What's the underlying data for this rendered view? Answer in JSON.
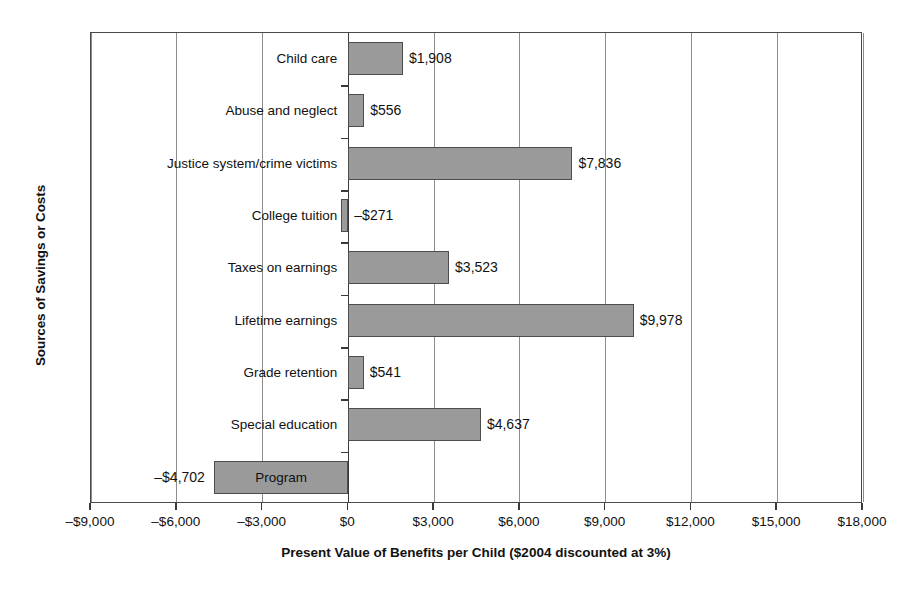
{
  "chart_data": {
    "type": "bar",
    "orientation": "horizontal",
    "title": "",
    "xlabel": "Present Value of Benefits per Child ($2004 discounted at 3%)",
    "ylabel": "Sources of Savings or Costs",
    "xlim": [
      -9000,
      18000
    ],
    "xticks": [
      -9000,
      -6000,
      -3000,
      0,
      3000,
      6000,
      9000,
      12000,
      15000,
      18000
    ],
    "xtick_labels": [
      "–$9,000",
      "–$6,000",
      "–$3,000",
      "$0",
      "$3,000",
      "$6,000",
      "$9,000",
      "$12,000",
      "$15,000",
      "$18,000"
    ],
    "grid": true,
    "legend": false,
    "categories": [
      "Child care",
      "Abuse and neglect",
      "Justice system/crime victims",
      "College tuition",
      "Taxes on earnings",
      "Lifetime earnings",
      "Grade retention",
      "Special education",
      "Program"
    ],
    "values": [
      1908,
      556,
      7836,
      -271,
      3523,
      9978,
      541,
      4637,
      -4702
    ],
    "data_labels": [
      "$1,908",
      "$556",
      "$7,836",
      "–$271",
      "$3,523",
      "$9,978",
      "$541",
      "$4,637",
      "–$4,702"
    ],
    "bar_color": "#9a9a9a",
    "bar_edge_color": "#4d4d4d"
  }
}
